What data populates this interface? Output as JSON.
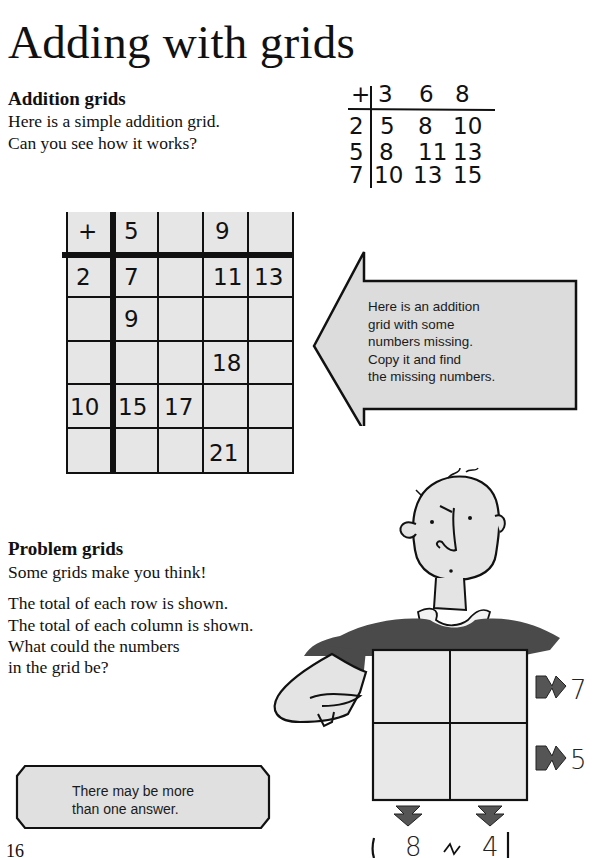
{
  "page": {
    "title": "Adding with grids",
    "page_number": "16"
  },
  "addition_section": {
    "heading": "Addition grids",
    "lines": [
      "Here is a simple addition grid.",
      "Can you see how it works?"
    ]
  },
  "simple_grid": {
    "operator": "+",
    "column_headers": [
      "3",
      "6",
      "8"
    ],
    "rows": [
      {
        "header": "2",
        "values": [
          "5",
          "8",
          "10"
        ]
      },
      {
        "header": "5",
        "values": [
          "8",
          "11",
          "13"
        ]
      },
      {
        "header": "7",
        "values": [
          "10",
          "13",
          "15"
        ]
      }
    ]
  },
  "missing_grid": {
    "operator": "+",
    "column_headers": [
      "5",
      "",
      "9",
      ""
    ],
    "rows": [
      {
        "header": "2",
        "values": [
          "7",
          "",
          "11",
          "13"
        ]
      },
      {
        "header": "",
        "values": [
          "9",
          "",
          "",
          ""
        ]
      },
      {
        "header": "",
        "values": [
          "",
          "",
          "18",
          ""
        ]
      },
      {
        "header": "10",
        "values": [
          "15",
          "17",
          "",
          ""
        ]
      },
      {
        "header": "",
        "values": [
          "",
          "",
          "21",
          ""
        ]
      }
    ]
  },
  "arrow_callout": {
    "lines": [
      "Here is an addition",
      "grid with some",
      "numbers missing.",
      "Copy it and find",
      "the missing numbers."
    ],
    "fill": "#dcdcdc"
  },
  "problem_section": {
    "heading": "Problem grids",
    "intro": "Some grids make you think!",
    "lines": [
      "The total of each row is shown.",
      "The total of each column is shown.",
      "What could the numbers",
      "in the grid be?"
    ]
  },
  "problem_grid": {
    "row_totals": [
      "7",
      "5"
    ],
    "column_totals": [
      "8",
      "4"
    ]
  },
  "hint_box": {
    "lines": [
      "There may be more",
      "than one answer."
    ]
  },
  "colors": {
    "shirt": "#4a4a4a",
    "skin": "#e4e4e4",
    "grid_fill": "#e6e6e6",
    "ink": "#111111"
  }
}
